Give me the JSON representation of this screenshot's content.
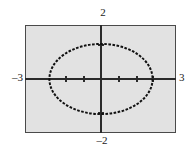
{
  "figure": {
    "kind": "graphing-calculator-plot",
    "background_color": "#ffffff",
    "plot_fill_color": "#e2e2e2",
    "frame_color": "#4a4a4a",
    "axis_color": "#2b2b2b",
    "curve_color": "#111111"
  },
  "labels": {
    "y_max": "2",
    "y_min": "–2",
    "x_min": "–3",
    "x_max": "3"
  },
  "chart_data": {
    "type": "line",
    "title": "",
    "subtitle": "",
    "xlabel": "",
    "ylabel": "",
    "grid": false,
    "legend": false,
    "legend_position": "none",
    "xlim": [
      -3,
      3
    ],
    "ylim": [
      -2,
      2
    ],
    "xticks": [
      -2,
      -1,
      0,
      1,
      2
    ],
    "yticks": [
      -1,
      0,
      1
    ],
    "xtick_labels": [
      "-3",
      "3"
    ],
    "ytick_labels": [
      "-2",
      "2"
    ],
    "curve_style": "dotted",
    "series": [
      {
        "name": "ellipse",
        "equation": "x^2/4 + y^2/1.3 = 1",
        "center": [
          0,
          0
        ],
        "semi_axis_x": 2.05,
        "semi_axis_y": 1.3,
        "closed": true
      }
    ],
    "annotations": [
      {
        "text": "2",
        "x": 0,
        "y": 2,
        "position": "above-axis-top"
      },
      {
        "text": "-2",
        "x": 0,
        "y": -2,
        "position": "below-axis-bottom"
      },
      {
        "text": "-3",
        "x": -3,
        "y": 0,
        "position": "left-of-axis"
      },
      {
        "text": "3",
        "x": 3,
        "y": 0,
        "position": "right-of-axis"
      }
    ]
  },
  "geometry": {
    "frame_px": {
      "left": 25,
      "top": 25,
      "width": 151,
      "height": 108
    },
    "origin_px": {
      "x": 76,
      "y": 54
    },
    "ellipse_px": {
      "rx": 52,
      "ry": 35
    }
  }
}
